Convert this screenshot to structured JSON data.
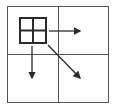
{
  "diagram": {
    "icon": "fill-cells-icon",
    "colors": {
      "stroke": "#2a2a2a",
      "grid": "#555555",
      "background": "#ffffff"
    },
    "arrows": [
      "right",
      "down",
      "diagonal-down-right"
    ]
  }
}
